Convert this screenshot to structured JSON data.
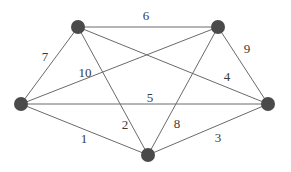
{
  "graph": {
    "type": "weighted-undirected-complete-graph",
    "nodes": [
      {
        "id": "TL",
        "x": 78,
        "y": 27
      },
      {
        "id": "TR",
        "x": 218,
        "y": 27
      },
      {
        "id": "L",
        "x": 21,
        "y": 104
      },
      {
        "id": "R",
        "x": 268,
        "y": 104
      },
      {
        "id": "B",
        "x": 148,
        "y": 155
      }
    ],
    "edges": [
      {
        "from": "TL",
        "to": "TR",
        "weight": "6",
        "label_x": 146,
        "label_y": 17
      },
      {
        "from": "TL",
        "to": "L",
        "weight": "7",
        "label_x": 45,
        "label_y": 58
      },
      {
        "from": "TR",
        "to": "L",
        "weight": "10",
        "label_x": 85,
        "label_y": 74
      },
      {
        "from": "TR",
        "to": "R",
        "weight": "9",
        "label_x": 247,
        "label_y": 50
      },
      {
        "from": "TL",
        "to": "R",
        "weight": "4",
        "label_x": 227,
        "label_y": 78
      },
      {
        "from": "L",
        "to": "R",
        "weight": "5",
        "label_x": 150,
        "label_y": 99
      },
      {
        "from": "TL",
        "to": "B",
        "weight": "2",
        "label_x": 125,
        "label_y": 126
      },
      {
        "from": "TR",
        "to": "B",
        "weight": "8",
        "label_x": 177,
        "label_y": 125
      },
      {
        "from": "L",
        "to": "B",
        "weight": "1",
        "label_x": 84,
        "label_y": 140
      },
      {
        "from": "R",
        "to": "B",
        "weight": "3",
        "label_x": 218,
        "label_y": 139
      }
    ],
    "colors": {
      "node": "#4a4a4a",
      "edge": "#6a6a6a",
      "label": "#3a3a3a",
      "background": "#ffffff"
    }
  }
}
